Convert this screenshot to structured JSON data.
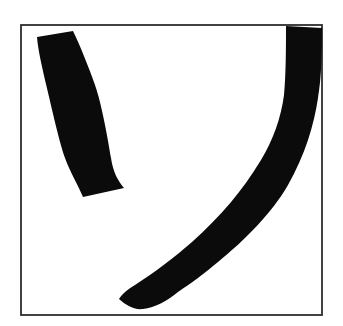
{
  "figure": {
    "background_color": "#ffffff",
    "ink_color": "#0b0b0b",
    "frame": {
      "border_color": "#2e2e2e",
      "fill_color": "#ffffff",
      "x": 21,
      "y": 25,
      "width": 301,
      "height": 290
    },
    "strokes": [
      {
        "name": "short-upper-left-stroke",
        "path": "M 37,37 L 73,31 C 80,45 89,68 95,85 C 102,105 108,140 111,158 C 113,172 118,181 124,188 L 83,197 C 78,185 70,172 65,158 C 58,138 50,100 45,80 C 42,66 38,50 37,37 Z"
      },
      {
        "name": "long-curved-stroke",
        "path": "M 286,26 L 322,28 C 322,60 321,80 318,98 C 314,125 305,155 288,185 C 272,213 245,240 218,262 C 205,273 190,284 178,292 C 168,300 155,308 143,309 C 133,310 126,305 119,299 C 122,294 127,290 135,285 C 155,272 175,257 192,242 C 220,217 243,190 261,160 C 273,140 281,118 284,95 C 286,75 286,45 286,26 Z"
      }
    ]
  }
}
